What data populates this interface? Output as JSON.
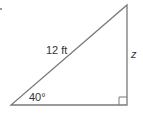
{
  "diagram": {
    "type": "right-triangle",
    "hypotenuse_label": "12 ft",
    "angle_label": "40°",
    "opposite_side_label": "z",
    "colors": {
      "stroke": "#7a7a7a",
      "text": "#333333"
    }
  }
}
